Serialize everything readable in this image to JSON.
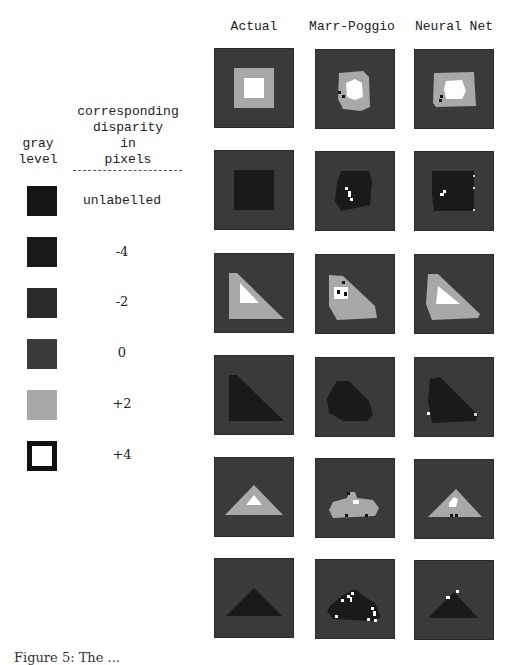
{
  "columns": [
    "Actual",
    "Marr-Poggio",
    "Neural Net"
  ],
  "legend": {
    "gray_header": [
      "gray",
      "level"
    ],
    "disparity_header": [
      "corresponding",
      "disparity",
      "in",
      "pixels"
    ],
    "items": [
      {
        "label": "unlabelled",
        "color": "#151515",
        "style": "solid"
      },
      {
        "label": "-4",
        "color": "#1a1a1a",
        "style": "solid"
      },
      {
        "label": "-2",
        "color": "#2a2a2a",
        "style": "solid"
      },
      {
        "label": "0",
        "color": "#3a3a3a",
        "style": "solid"
      },
      {
        "label": "+2",
        "color": "#a8a8a8",
        "style": "solid"
      },
      {
        "label": "+4",
        "color": "#ffffff",
        "style": "outlined"
      }
    ]
  },
  "rows": [
    {
      "shape": "nested-square",
      "description": "+2 square with +4 inner square on 0 background"
    },
    {
      "shape": "square",
      "description": "-4 square on 0 background"
    },
    {
      "shape": "right-triangle",
      "description": "+2 right triangle with +4 inner triangle"
    },
    {
      "shape": "right-triangle",
      "description": "-4 right triangle"
    },
    {
      "shape": "isosceles-triangle",
      "description": "+2 triangle with +4 inner triangle"
    },
    {
      "shape": "isosceles-triangle",
      "description": "-4 triangle"
    }
  ],
  "caption": {
    "text": "Figure 5: The ...",
    "clipped": true
  }
}
